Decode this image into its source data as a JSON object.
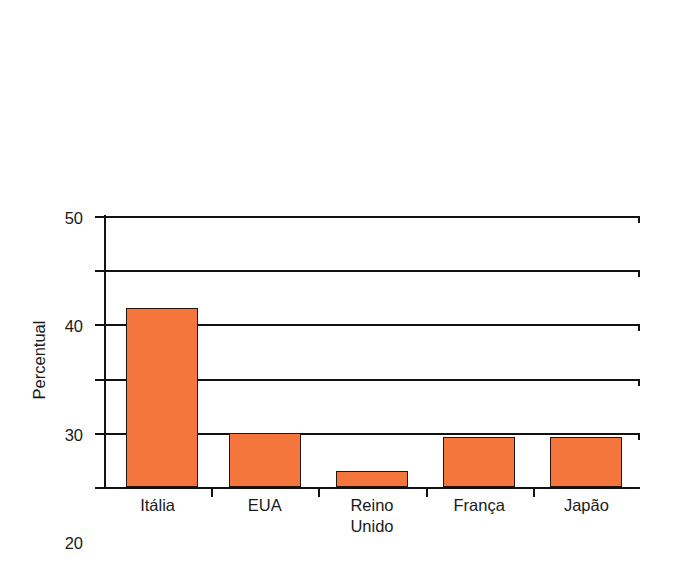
{
  "chart_data": {
    "type": "bar",
    "title": "",
    "subtitle": "",
    "xlabel": "",
    "ylabel": "Percentual",
    "categories": [
      "Itália",
      "EUA",
      "Reino\nUnido",
      "França",
      "Japão"
    ],
    "values": [
      33,
      10,
      3,
      9.3,
      9.3
    ],
    "ylim": [
      0,
      50
    ],
    "yticks": [
      0,
      10,
      20,
      30,
      40,
      50
    ],
    "ytick_labels": [
      "0",
      "10",
      "20",
      "30",
      "40",
      "50"
    ],
    "grid": true,
    "legend": false,
    "legend_position": "none",
    "bar_color": "#f4763c",
    "bar_edge_color": "#24160f",
    "axis_color": "#121212",
    "background_color": "#ffffff"
  },
  "axis": {
    "y_title": "Percentual",
    "ticks": [
      {
        "label": "50",
        "value": 50
      },
      {
        "label": "40",
        "value": 40
      },
      {
        "label": "30",
        "value": 30
      },
      {
        "label": "20",
        "value": 20
      },
      {
        "label": "10",
        "value": 10
      },
      {
        "label": "0",
        "value": 0
      }
    ]
  },
  "bars": [
    {
      "label": "Itália",
      "value": 33
    },
    {
      "label": "EUA",
      "value": 10
    },
    {
      "label": "Reino\nUnido",
      "value": 3
    },
    {
      "label": "França",
      "value": 9.3
    },
    {
      "label": "Japão",
      "value": 9.3
    }
  ]
}
